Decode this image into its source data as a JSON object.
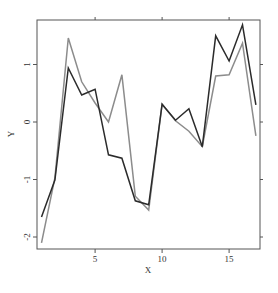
{
  "chart_data": {
    "type": "line",
    "title": "",
    "xlabel": "X",
    "ylabel": "Y",
    "xlim": [
      0.7,
      17.3
    ],
    "ylim": [
      -2.2,
      1.8
    ],
    "grid": false,
    "legend": null,
    "x_ticks": [
      5,
      10,
      15
    ],
    "y_ticks": [
      -2,
      -1,
      0,
      1
    ],
    "x": [
      1,
      2,
      3,
      4,
      5,
      6,
      7,
      8,
      9,
      10,
      11,
      12,
      13,
      14,
      15,
      16,
      17
    ],
    "series": [
      {
        "name": "series-1",
        "color": "#2b2b2b",
        "values": [
          -1.65,
          -1.01,
          0.94,
          0.47,
          0.57,
          -0.57,
          -0.63,
          -1.37,
          -1.44,
          0.31,
          0.03,
          0.23,
          -0.43,
          1.5,
          1.06,
          1.69,
          0.3
        ]
      },
      {
        "name": "series-2",
        "color": "#8c8c8c",
        "values": [
          -2.1,
          -0.97,
          1.46,
          0.7,
          0.33,
          0.0,
          0.82,
          -1.29,
          -1.53,
          0.31,
          0.02,
          -0.16,
          -0.43,
          0.8,
          0.82,
          1.37,
          -0.24
        ]
      }
    ]
  },
  "axes": {
    "x_title": "X",
    "y_title": "Y",
    "x_tick_labels": [
      "5",
      "10",
      "15"
    ],
    "y_tick_labels": [
      "-2",
      "-1",
      "0",
      "1"
    ]
  }
}
